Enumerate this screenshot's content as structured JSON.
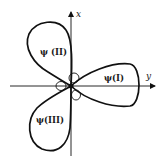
{
  "diagram": {
    "type": "orbital-lobes",
    "axes": {
      "vertical_label": "x",
      "horizontal_label": "y"
    },
    "lobes": [
      {
        "id": "I",
        "label": "ψ(I)",
        "direction": "right"
      },
      {
        "id": "II",
        "label": "ψ (II)",
        "direction": "upper-left"
      },
      {
        "id": "III",
        "label": "ψ(III)",
        "direction": "lower-left"
      }
    ],
    "colors": {
      "stroke": "#111111",
      "background": "#ffffff"
    }
  }
}
